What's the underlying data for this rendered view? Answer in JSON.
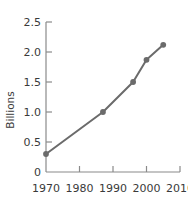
{
  "chart_data": {
    "type": "line",
    "title": "",
    "xlabel": "",
    "ylabel": "Billions",
    "xlim": [
      1970,
      2010
    ],
    "ylim": [
      0,
      2.5
    ],
    "grid": false,
    "legend": "none",
    "x": [
      1970,
      1987,
      1996,
      2000,
      2005
    ],
    "values": [
      0.3,
      1.0,
      1.5,
      1.87,
      2.12
    ],
    "series": [
      {
        "name": "Billions",
        "x": [
          1970,
          1987,
          1996,
          2000,
          2005
        ],
        "values": [
          0.3,
          1.0,
          1.5,
          1.87,
          2.12
        ]
      }
    ],
    "xticks": [
      1970,
      1980,
      1990,
      2000,
      2010
    ],
    "xtick_labels": [
      "1970",
      "1980",
      "1990",
      "2000",
      "2010"
    ],
    "yticks": [
      0,
      0.5,
      1.0,
      1.5,
      2.0,
      2.5
    ],
    "ytick_labels": [
      "0",
      "0.5",
      "1.0",
      "1.5",
      "2.0",
      "2.5"
    ],
    "colors": {
      "line": "#6b6b6b",
      "marker": "#6b6b6b",
      "axis": "#8a8a8a",
      "text": "#3a3a3a",
      "background": "#ffffff"
    }
  },
  "axis": {
    "y_title": "Billions"
  }
}
